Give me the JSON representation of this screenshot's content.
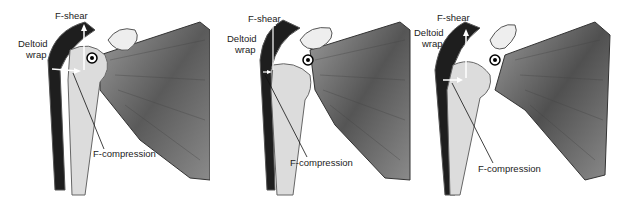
{
  "figure": {
    "panels": [
      {
        "id": "panel-1",
        "labels": {
          "shear": "F-shear",
          "wrap_line1": "Deltoid",
          "wrap_line2": "wrap",
          "compression": "F-compression"
        }
      },
      {
        "id": "panel-2",
        "labels": {
          "shear": "F-shear",
          "wrap_line1": "Deltoid",
          "wrap_line2": "wrap",
          "compression": "F-compression"
        }
      },
      {
        "id": "panel-3",
        "labels": {
          "shear": "F-shear",
          "wrap_line1": "Deltoid",
          "wrap_line2": "wrap",
          "compression": "F-compression"
        }
      }
    ]
  },
  "colors": {
    "muscle_light": "#c9c9c9",
    "muscle_dark": "#3a3a3a",
    "bone": "#e2e2e2",
    "deltoid_dark": "#1a1a1a",
    "arrow": "#ffffff",
    "leader": "#111111"
  }
}
